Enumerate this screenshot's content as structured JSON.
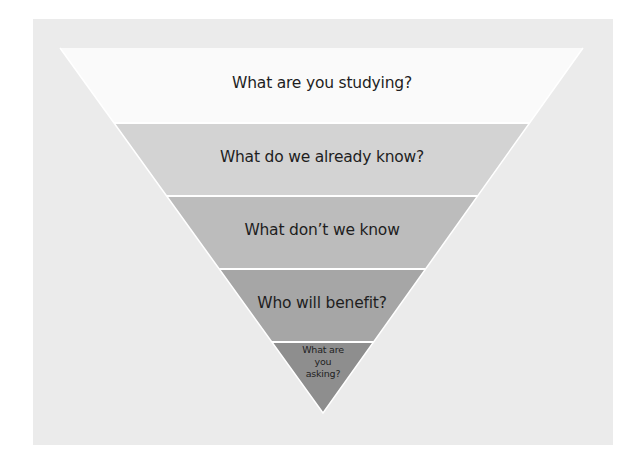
{
  "diagram": {
    "type": "inverted-funnel",
    "levels": [
      {
        "label": "What are you studying?",
        "color": "#fafafa"
      },
      {
        "label": "What do we already know?",
        "color": "#d3d3d3"
      },
      {
        "label": "What don’t we know",
        "color": "#bcbcbc"
      },
      {
        "label": "Who will benefit?",
        "color": "#a6a6a6"
      },
      {
        "label_lines": [
          "What are",
          "you",
          "asking?"
        ],
        "color": "#8e8e8e"
      }
    ],
    "background_color": "#ebebeb",
    "separator_color": "#ffffff"
  }
}
